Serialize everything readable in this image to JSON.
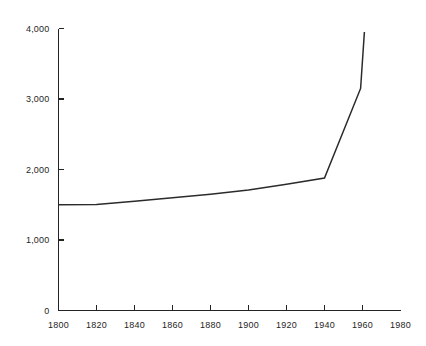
{
  "chart_data": {
    "type": "line",
    "title": "",
    "subtitle": "",
    "xlabel": "",
    "ylabel": "",
    "xlim": [
      1800,
      1980
    ],
    "ylim": [
      0,
      4000
    ],
    "grid": false,
    "legend": null,
    "x_ticks": [
      1800,
      1820,
      1840,
      1860,
      1880,
      1900,
      1920,
      1940,
      1960,
      1980
    ],
    "x_tick_labels": [
      "1800",
      "1820",
      "1840",
      "1860",
      "1880",
      "1900",
      "1920",
      "1940",
      "1960",
      "1980"
    ],
    "y_ticks": [
      0,
      1000,
      2000,
      3000,
      4000
    ],
    "y_tick_labels": [
      "0",
      "1,000",
      "2,000",
      "3,000",
      "4,000"
    ],
    "series": [
      {
        "name": "",
        "color": "#2b2b2b",
        "x": [
          1800,
          1820,
          1840,
          1860,
          1880,
          1900,
          1920,
          1940,
          1959,
          1961
        ],
        "values": [
          1500,
          1505,
          1550,
          1600,
          1650,
          1710,
          1790,
          1880,
          3150,
          3950
        ]
      }
    ]
  },
  "axes": {
    "y_axis_name": "y-axis",
    "x_axis_name": "x-axis"
  }
}
